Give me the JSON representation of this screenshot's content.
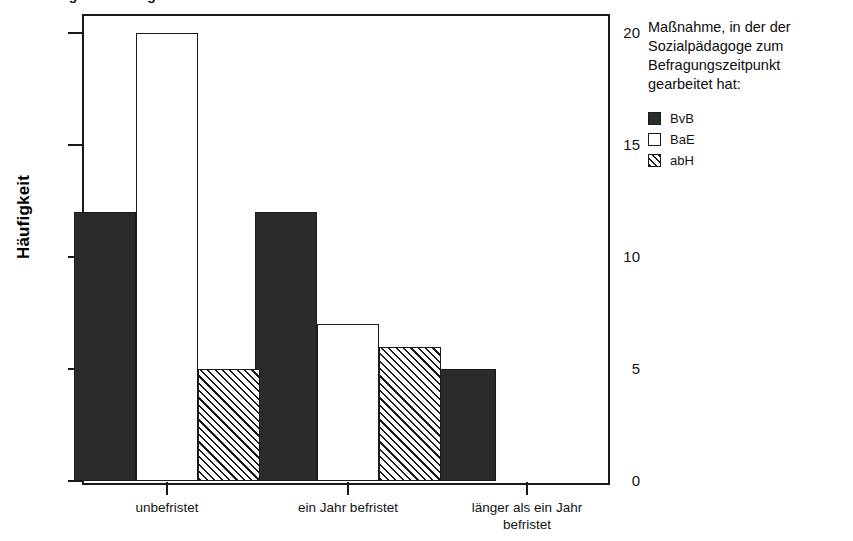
{
  "chart_data": {
    "type": "bar",
    "title": "",
    "xlabel": "",
    "ylabel": "Häufigkeit",
    "ylim": [
      0,
      21
    ],
    "yticks": [
      0,
      5,
      10,
      15,
      20
    ],
    "ytick_labels": [
      "0",
      "5",
      "10",
      "15",
      "20"
    ],
    "grid": false,
    "legend_position": "right",
    "categories": [
      "unbefristet",
      "ein Jahr befristet",
      "länger als ein Jahr befristet"
    ],
    "series": [
      {
        "name": "BvB",
        "fill": "solid",
        "values": [
          12,
          12,
          5
        ]
      },
      {
        "name": "BaE",
        "fill": "hollow",
        "values": [
          20,
          7,
          0
        ]
      },
      {
        "name": "abH",
        "fill": "hatched",
        "values": [
          5,
          6,
          0
        ]
      }
    ]
  },
  "legend": {
    "title": "Maßnahme, in der der Sozialpädagoge zum Befragungszeitpunkt gearbeitet hat:",
    "entries": [
      {
        "label": "BvB",
        "fill": "solid"
      },
      {
        "label": "BaE",
        "fill": "hollow"
      },
      {
        "label": "abH",
        "fill": "hatched"
      }
    ]
  },
  "colors": {
    "bar_solid": "#2b2b2b",
    "bar_hollow": "#ffffff",
    "hatch_line": "#1a1a1a",
    "axis": "#1a1a1a",
    "text": "#141414",
    "background": "#ffffff"
  },
  "title_remnant": "Abbildung: Befristung des Arbeitsverhältnisses"
}
